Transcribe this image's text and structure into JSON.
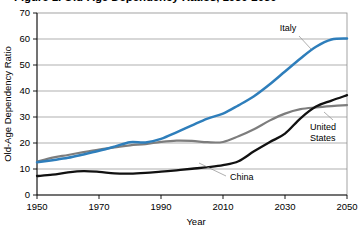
{
  "chart_data": {
    "type": "line",
    "title": "Figure 1.  Old-Age Dependency Ratios, 1950-2050",
    "xlabel": "Year",
    "ylabel": "Old-Age Dependency Ratio",
    "xlim": [
      1950,
      2050
    ],
    "ylim": [
      0,
      70
    ],
    "xticks": [
      "1950",
      "1970",
      "1990",
      "2010",
      "2030",
      "2050"
    ],
    "xtick_values": [
      1950,
      1970,
      1990,
      2010,
      2030,
      2050
    ],
    "yticks": [
      "0",
      "10",
      "20",
      "30",
      "40",
      "50",
      "60",
      "70"
    ],
    "ytick_values": [
      0,
      10,
      20,
      30,
      40,
      50,
      60,
      70
    ],
    "grid": "horizontal",
    "legend_position": "inline-annotations",
    "x": [
      1950,
      1955,
      1960,
      1965,
      1970,
      1975,
      1980,
      1985,
      1990,
      1995,
      2000,
      2005,
      2010,
      2015,
      2020,
      2025,
      2030,
      2035,
      2040,
      2045,
      2050
    ],
    "series": [
      {
        "name": "Italy",
        "color": "#2e7ebb",
        "label_text": "Italy",
        "values": [
          12.6,
          13.4,
          14.3,
          15.6,
          17.0,
          18.6,
          20.3,
          20.2,
          21.6,
          24.1,
          26.8,
          29.4,
          31.3,
          34.5,
          38.0,
          42.5,
          47.5,
          52.5,
          57.0,
          59.8,
          60.2
        ]
      },
      {
        "name": "United States",
        "color": "#7d7d7d",
        "label_text": "United States",
        "values": [
          12.8,
          14.4,
          15.4,
          16.5,
          17.5,
          18.3,
          19.1,
          19.6,
          20.4,
          20.9,
          20.8,
          20.3,
          20.4,
          22.6,
          25.3,
          28.6,
          31.3,
          33.0,
          33.7,
          34.2,
          34.6
        ]
      },
      {
        "name": "China",
        "color": "#111111",
        "label_text": "China",
        "values": [
          7.3,
          7.8,
          8.7,
          9.2,
          8.9,
          8.3,
          8.2,
          8.5,
          9.0,
          9.5,
          10.1,
          10.7,
          11.5,
          13.0,
          16.8,
          20.3,
          23.6,
          29.5,
          34.0,
          36.3,
          38.4
        ]
      }
    ]
  },
  "annotations": [
    {
      "name": "italy-label",
      "text": "Italy"
    },
    {
      "name": "united-states-label",
      "text": "United States"
    },
    {
      "name": "china-label",
      "text": "China"
    }
  ]
}
